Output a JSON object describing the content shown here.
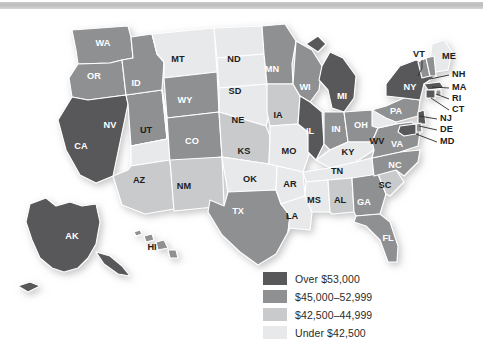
{
  "figure": {
    "background_color": "#ffffff",
    "scan_band_color": "#c4c4c4"
  },
  "palette": {
    "tier1": "#58585a",
    "tier2": "#8e9092",
    "tier3": "#c9cacb",
    "tier4": "#e8e9ea",
    "border": "#ffffff",
    "label_dark": "#1d1d1d",
    "label_light": "#ffffff"
  },
  "legend": {
    "items": [
      {
        "label": "Over $53,000",
        "color": "#58585a",
        "tier": "tier1"
      },
      {
        "label": "$45,000–52,999",
        "color": "#8e9092",
        "tier": "tier2"
      },
      {
        "label": "$42,500–44,999",
        "color": "#c9cacb",
        "tier": "tier3"
      },
      {
        "label": "Under $42,500",
        "color": "#e8e9ea",
        "tier": "tier4"
      }
    ]
  },
  "chart_data": {
    "type": "choropleth-map",
    "title": "",
    "value_field": "median household income",
    "bins": [
      {
        "label": "Over $53,000",
        "min": 53000,
        "max": null,
        "color": "#58585a"
      },
      {
        "label": "$45,000–52,999",
        "min": 45000,
        "max": 52999,
        "color": "#8e9092"
      },
      {
        "label": "$42,500–44,999",
        "min": 42500,
        "max": 44999,
        "color": "#c9cacb"
      },
      {
        "label": "Under $42,500",
        "min": null,
        "max": 42499,
        "color": "#e8e9ea"
      }
    ],
    "states": [
      {
        "code": "WA",
        "tier": "tier2",
        "label_color": "light"
      },
      {
        "code": "OR",
        "tier": "tier2",
        "label_color": "light"
      },
      {
        "code": "CA",
        "tier": "tier1",
        "label_color": "light"
      },
      {
        "code": "NV",
        "tier": "tier2",
        "label_color": "light"
      },
      {
        "code": "ID",
        "tier": "tier2",
        "label_color": "light"
      },
      {
        "code": "MT",
        "tier": "tier4",
        "label_color": "dark"
      },
      {
        "code": "WY",
        "tier": "tier2",
        "label_color": "light"
      },
      {
        "code": "UT",
        "tier": "tier4",
        "label_color": "dark"
      },
      {
        "code": "AZ",
        "tier": "tier3",
        "label_color": "dark"
      },
      {
        "code": "CO",
        "tier": "tier2",
        "label_color": "light"
      },
      {
        "code": "NM",
        "tier": "tier3",
        "label_color": "dark"
      },
      {
        "code": "ND",
        "tier": "tier4",
        "label_color": "dark"
      },
      {
        "code": "SD",
        "tier": "tier4",
        "label_color": "dark"
      },
      {
        "code": "NE",
        "tier": "tier4",
        "label_color": "dark"
      },
      {
        "code": "KS",
        "tier": "tier3",
        "label_color": "dark"
      },
      {
        "code": "OK",
        "tier": "tier4",
        "label_color": "dark"
      },
      {
        "code": "TX",
        "tier": "tier2",
        "label_color": "light"
      },
      {
        "code": "MN",
        "tier": "tier2",
        "label_color": "light"
      },
      {
        "code": "IA",
        "tier": "tier3",
        "label_color": "dark"
      },
      {
        "code": "MO",
        "tier": "tier4",
        "label_color": "dark"
      },
      {
        "code": "AR",
        "tier": "tier4",
        "label_color": "dark"
      },
      {
        "code": "LA",
        "tier": "tier4",
        "label_color": "dark"
      },
      {
        "code": "WI",
        "tier": "tier2",
        "label_color": "light"
      },
      {
        "code": "IL",
        "tier": "tier1",
        "label_color": "light"
      },
      {
        "code": "MI",
        "tier": "tier1",
        "label_color": "light"
      },
      {
        "code": "IN",
        "tier": "tier2",
        "label_color": "light"
      },
      {
        "code": "OH",
        "tier": "tier2",
        "label_color": "light"
      },
      {
        "code": "KY",
        "tier": "tier4",
        "label_color": "dark"
      },
      {
        "code": "TN",
        "tier": "tier4",
        "label_color": "dark"
      },
      {
        "code": "MS",
        "tier": "tier4",
        "label_color": "dark"
      },
      {
        "code": "AL",
        "tier": "tier3",
        "label_color": "dark"
      },
      {
        "code": "GA",
        "tier": "tier2",
        "label_color": "light"
      },
      {
        "code": "FL",
        "tier": "tier2",
        "label_color": "light"
      },
      {
        "code": "SC",
        "tier": "tier3",
        "label_color": "dark"
      },
      {
        "code": "NC",
        "tier": "tier2",
        "label_color": "light"
      },
      {
        "code": "VA",
        "tier": "tier2",
        "label_color": "light"
      },
      {
        "code": "WV",
        "tier": "tier4",
        "label_color": "dark"
      },
      {
        "code": "PA",
        "tier": "tier2",
        "label_color": "light"
      },
      {
        "code": "NY",
        "tier": "tier1",
        "label_color": "light"
      },
      {
        "code": "ME",
        "tier": "tier4",
        "label_color": "dark"
      },
      {
        "code": "VT",
        "tier": "tier2",
        "label_color": "dark"
      },
      {
        "code": "NH",
        "tier": "tier2",
        "label_color": "dark"
      },
      {
        "code": "MA",
        "tier": "tier1",
        "label_color": "dark"
      },
      {
        "code": "RI",
        "tier": "tier2",
        "label_color": "dark"
      },
      {
        "code": "CT",
        "tier": "tier1",
        "label_color": "dark"
      },
      {
        "code": "NJ",
        "tier": "tier1",
        "label_color": "dark"
      },
      {
        "code": "DE",
        "tier": "tier2",
        "label_color": "dark"
      },
      {
        "code": "MD",
        "tier": "tier1",
        "label_color": "dark"
      },
      {
        "code": "AK",
        "tier": "tier1",
        "label_color": "light"
      },
      {
        "code": "HI",
        "tier": "tier2",
        "label_color": "dark"
      }
    ]
  },
  "map_labels": {
    "inline": [
      {
        "code": "WA",
        "x": 103,
        "y": 44
      },
      {
        "code": "OR",
        "x": 94,
        "y": 77
      },
      {
        "code": "CA",
        "x": 81,
        "y": 147
      },
      {
        "code": "NV",
        "x": 110,
        "y": 126
      },
      {
        "code": "ID",
        "x": 136,
        "y": 84
      },
      {
        "code": "MT",
        "x": 178,
        "y": 60
      },
      {
        "code": "WY",
        "x": 185,
        "y": 101
      },
      {
        "code": "UT",
        "x": 146,
        "y": 131
      },
      {
        "code": "AZ",
        "x": 139,
        "y": 181
      },
      {
        "code": "CO",
        "x": 192,
        "y": 142
      },
      {
        "code": "NM",
        "x": 184,
        "y": 187
      },
      {
        "code": "ND",
        "x": 234,
        "y": 60
      },
      {
        "code": "SD",
        "x": 235,
        "y": 92
      },
      {
        "code": "NE",
        "x": 238,
        "y": 121
      },
      {
        "code": "KS",
        "x": 244,
        "y": 152
      },
      {
        "code": "OK",
        "x": 250,
        "y": 180
      },
      {
        "code": "TX",
        "x": 238,
        "y": 212
      },
      {
        "code": "MN",
        "x": 272,
        "y": 70
      },
      {
        "code": "IA",
        "x": 278,
        "y": 116
      },
      {
        "code": "MO",
        "x": 289,
        "y": 152
      },
      {
        "code": "AR",
        "x": 290,
        "y": 185
      },
      {
        "code": "LA",
        "x": 292,
        "y": 217
      },
      {
        "code": "WI",
        "x": 305,
        "y": 88
      },
      {
        "code": "IL",
        "x": 310,
        "y": 132
      },
      {
        "code": "MI",
        "x": 342,
        "y": 97
      },
      {
        "code": "IN",
        "x": 336,
        "y": 130
      },
      {
        "code": "OH",
        "x": 361,
        "y": 126
      },
      {
        "code": "KY",
        "x": 348,
        "y": 153
      },
      {
        "code": "TN",
        "x": 337,
        "y": 172
      },
      {
        "code": "MS",
        "x": 314,
        "y": 201
      },
      {
        "code": "AL",
        "x": 340,
        "y": 201
      },
      {
        "code": "GA",
        "x": 364,
        "y": 203
      },
      {
        "code": "FL",
        "x": 388,
        "y": 239
      },
      {
        "code": "SC",
        "x": 385,
        "y": 186
      },
      {
        "code": "NC",
        "x": 395,
        "y": 166
      },
      {
        "code": "VA",
        "x": 397,
        "y": 145
      },
      {
        "code": "WV",
        "x": 377,
        "y": 142
      },
      {
        "code": "PA",
        "x": 396,
        "y": 112
      },
      {
        "code": "NY",
        "x": 410,
        "y": 88
      },
      {
        "code": "AK",
        "x": 72,
        "y": 237
      },
      {
        "code": "HI",
        "x": 152,
        "y": 248
      }
    ],
    "callouts": [
      {
        "code": "VT",
        "tx": 413,
        "ty": 55,
        "line": [
          [
            422,
            60
          ],
          [
            422,
            68
          ],
          [
            418,
            76
          ]
        ]
      },
      {
        "code": "ME",
        "tx": 442,
        "ty": 57,
        "line": null
      },
      {
        "code": "NH",
        "tx": 452,
        "ty": 75,
        "line": [
          [
            449,
            75
          ],
          [
            430,
            79
          ]
        ]
      },
      {
        "code": "MA",
        "tx": 452,
        "ty": 88,
        "line": [
          [
            449,
            88
          ],
          [
            432,
            87
          ]
        ]
      },
      {
        "code": "RI",
        "tx": 452,
        "ty": 99,
        "line": [
          [
            449,
            99
          ],
          [
            436,
            94
          ]
        ]
      },
      {
        "code": "CT",
        "tx": 452,
        "ty": 110,
        "line": [
          [
            449,
            110
          ],
          [
            431,
            98
          ]
        ]
      },
      {
        "code": "NJ",
        "tx": 440,
        "ty": 119,
        "line": [
          [
            437,
            119
          ],
          [
            419,
            116
          ]
        ]
      },
      {
        "code": "DE",
        "tx": 440,
        "ty": 130,
        "line": [
          [
            437,
            130
          ],
          [
            419,
            126
          ]
        ]
      },
      {
        "code": "MD",
        "tx": 440,
        "ty": 142,
        "line": [
          [
            437,
            142
          ],
          [
            416,
            134
          ]
        ]
      }
    ]
  }
}
